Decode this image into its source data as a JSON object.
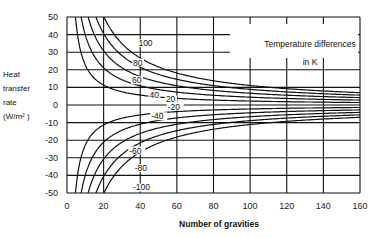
{
  "chart_data": {
    "type": "line",
    "title": "",
    "xlabel": "Number of gravities",
    "ylabel": [
      "Heat",
      "transfer",
      "rate",
      "(W/m² )"
    ],
    "xlim": [
      0,
      160
    ],
    "ylim": [
      -50,
      50
    ],
    "x_ticks": [
      0,
      20,
      40,
      60,
      80,
      100,
      120,
      140,
      160
    ],
    "y_ticks": [
      50,
      40,
      30,
      20,
      10,
      0,
      -10,
      -20,
      -30,
      -40,
      -50
    ],
    "grid": true,
    "legend_title": [
      "Temperature differences",
      "in K"
    ],
    "series": [
      {
        "name": "100",
        "dT": 100,
        "K": 1138,
        "g0": -2.6,
        "points": [
          [
            20.2,
            50
          ],
          [
            40,
            21
          ],
          [
            80,
            11
          ],
          [
            160,
            7
          ]
        ]
      },
      {
        "name": "80",
        "dT": 80,
        "K": 910,
        "g0": -2.4,
        "points": [
          [
            15.8,
            50
          ],
          [
            40,
            17
          ],
          [
            80,
            9
          ],
          [
            160,
            5.5
          ]
        ]
      },
      {
        "name": "60",
        "dT": 60,
        "K": 680,
        "g0": -2.1,
        "points": [
          [
            11.5,
            50
          ],
          [
            40,
            13
          ],
          [
            80,
            7
          ],
          [
            160,
            4
          ]
        ]
      },
      {
        "name": "40",
        "dT": 40,
        "K": 450,
        "g0": -1.3,
        "points": [
          [
            7.7,
            50
          ],
          [
            40,
            8
          ],
          [
            80,
            4.5
          ],
          [
            160,
            2.8
          ]
        ]
      },
      {
        "name": "20",
        "dT": 20,
        "K": 225,
        "g0": 0.1,
        "points": [
          [
            4.4,
            50
          ],
          [
            40,
            4
          ],
          [
            80,
            2.5
          ],
          [
            160,
            1.4
          ]
        ]
      },
      {
        "name": "-20",
        "dT": -20,
        "K": -225,
        "g0": 0.1,
        "points": [
          [
            4.4,
            -50
          ],
          [
            40,
            -4
          ],
          [
            80,
            -2.5
          ],
          [
            160,
            -1.4
          ]
        ]
      },
      {
        "name": "-40",
        "dT": -40,
        "K": -450,
        "g0": -1.3,
        "points": [
          [
            7.7,
            -50
          ],
          [
            40,
            -8
          ],
          [
            80,
            -4.5
          ],
          [
            160,
            -2.8
          ]
        ]
      },
      {
        "name": "-60",
        "dT": -60,
        "K": -680,
        "g0": -2.1,
        "points": [
          [
            11.5,
            -50
          ],
          [
            40,
            -13
          ],
          [
            80,
            -7
          ],
          [
            160,
            -4
          ]
        ]
      },
      {
        "name": "-80",
        "dT": -80,
        "K": -910,
        "g0": -2.4,
        "points": [
          [
            15.8,
            -50
          ],
          [
            40,
            -17
          ],
          [
            80,
            -9
          ],
          [
            160,
            -5.5
          ]
        ]
      },
      {
        "name": "-100",
        "dT": -100,
        "K": -1138,
        "g0": -2.6,
        "points": [
          [
            20.2,
            -50
          ],
          [
            40,
            -21
          ],
          [
            80,
            -11
          ],
          [
            160,
            -7
          ]
        ]
      }
    ],
    "curve_labels": [
      {
        "text": "100",
        "x": 39,
        "y": 34
      },
      {
        "text": "80",
        "x": 36,
        "y": 23
      },
      {
        "text": "60",
        "x": 35.5,
        "y": 13
      },
      {
        "text": "40",
        "x": 45,
        "y": 4.5
      },
      {
        "text": "20",
        "x": 54,
        "y": 2
      },
      {
        "text": "-20",
        "x": 55,
        "y": -2
      },
      {
        "text": "-40",
        "x": 46,
        "y": -7.5
      },
      {
        "text": "-60",
        "x": 34,
        "y": -27
      },
      {
        "text": "-80",
        "x": 37,
        "y": -37
      },
      {
        "text": "-100",
        "x": 36,
        "y": -48
      }
    ]
  }
}
